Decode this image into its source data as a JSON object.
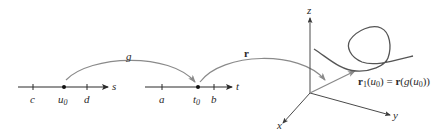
{
  "diagram": {
    "left_line": {
      "axis_label": "s",
      "ticks": [
        {
          "label": "c"
        },
        {
          "label": "u",
          "sub": "0",
          "point": true
        },
        {
          "label": "d"
        }
      ]
    },
    "middle_line": {
      "axis_label": "t",
      "ticks": [
        {
          "label": "a"
        },
        {
          "label": "t",
          "sub": "0",
          "point": true
        },
        {
          "label": "b"
        }
      ]
    },
    "maps": {
      "g_label": "g",
      "r_label": "r"
    },
    "space": {
      "x_label": "x",
      "y_label": "y",
      "z_label": "z",
      "equation": {
        "lhs_bold": "r",
        "lhs_sub": "1",
        "lhs_rest_open": "(",
        "lhs_var": "u",
        "lhs_var_sub": "0",
        "lhs_rest_close": ") = ",
        "rhs_bold": "r",
        "rhs_open": "(",
        "rhs_func": "g",
        "rhs_open2": "(",
        "rhs_var": "u",
        "rhs_var_sub": "0",
        "rhs_close": "))"
      }
    },
    "colors": {
      "axis": "#2a2a2a",
      "arc": "#8a8a8a",
      "curve": "#555555"
    }
  }
}
